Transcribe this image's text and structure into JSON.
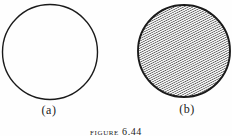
{
  "figure": {
    "caption": "figure 6.44",
    "panels": [
      {
        "label": "(a)",
        "fill": "none",
        "description": "empty circle"
      },
      {
        "label": "(b)",
        "fill": "hatched",
        "description": "circle filled with diagonal hatching"
      }
    ]
  },
  "colors": {
    "ink": "#1a1a1a",
    "hatch": "#2e2e2e",
    "background": "#fefefe"
  }
}
